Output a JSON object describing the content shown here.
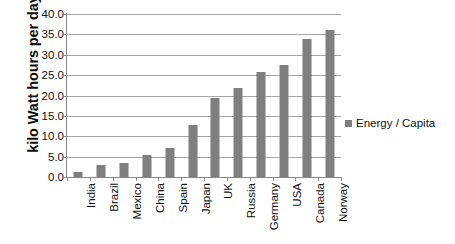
{
  "chart_data": {
    "type": "bar",
    "title": "",
    "subtitle": "",
    "xlabel": "",
    "ylabel": "kilo Watt hours per day",
    "ylim": [
      0,
      40
    ],
    "yticks": [
      0,
      5,
      10,
      15,
      20,
      25,
      30,
      35,
      40
    ],
    "ytick_labels": [
      "0.0",
      "5.0",
      "10.0",
      "15.0",
      "20.0",
      "25.0",
      "30.0",
      "35.0",
      "40.0"
    ],
    "grid": "horizontal",
    "legend_position": "right",
    "bar_color": "#7f7f7f",
    "gridline_color": "#a6a6a6",
    "axis_color": "#868686",
    "categories": [
      "India",
      "Brazil",
      "Mexico",
      "China",
      "Spain",
      "Japan",
      "UK",
      "Russia",
      "Germany",
      "USA",
      "Canada",
      "Norway"
    ],
    "series": [
      {
        "name": "Energy / Capita",
        "values": [
          1.2,
          3.0,
          3.4,
          5.5,
          7.2,
          12.7,
          19.5,
          21.8,
          25.7,
          27.6,
          33.9,
          36.2
        ]
      }
    ],
    "legend": [
      "Energy / Capita"
    ]
  },
  "legend": {
    "label": "Energy / Capita",
    "marker_name": "legend-color-swatch"
  }
}
